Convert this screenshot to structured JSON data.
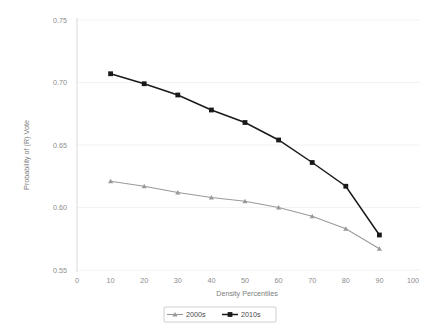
{
  "chart_data": {
    "type": "line",
    "title": "",
    "xlabel": "Density Percentiles",
    "ylabel": "Probability of (R) Vote",
    "x": [
      10,
      20,
      30,
      40,
      50,
      60,
      70,
      80,
      90
    ],
    "xlim": [
      0,
      100
    ],
    "ylim": [
      0.55,
      0.75
    ],
    "xticks": [
      "0",
      "10",
      "20",
      "30",
      "40",
      "50",
      "60",
      "70",
      "80",
      "90",
      "100"
    ],
    "yticks": [
      "0.55",
      "0.60",
      "0.65",
      "0.70",
      "0.75"
    ],
    "grid": "horizontal",
    "legend_position": "bottom-center",
    "series": [
      {
        "name": "2000s",
        "color": "#9a9a9a",
        "marker": "triangle",
        "values": [
          0.621,
          0.617,
          0.612,
          0.608,
          0.605,
          0.6,
          0.593,
          0.583,
          0.567
        ]
      },
      {
        "name": "2010s",
        "color": "#1a1a1a",
        "marker": "square",
        "values": [
          0.707,
          0.699,
          0.69,
          0.678,
          0.668,
          0.654,
          0.636,
          0.617,
          0.578
        ]
      }
    ]
  },
  "legend": {
    "entries": [
      {
        "label": "2000s"
      },
      {
        "label": "2010s"
      }
    ]
  },
  "colors": {
    "series_2000s": "#9a9a9a",
    "series_2010s": "#1a1a1a",
    "gridline": "#f2f2f2",
    "axis": "#d8d8d8",
    "tick_text": "#8c8c8c",
    "background": "#ffffff"
  }
}
